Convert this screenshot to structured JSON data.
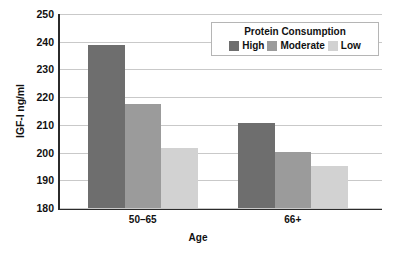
{
  "chart_data": {
    "type": "bar",
    "title": "",
    "xlabel": "Age",
    "ylabel": "IGF-I ng/ml",
    "ylim": [
      180,
      250
    ],
    "yticks": [
      180,
      190,
      200,
      210,
      220,
      230,
      240,
      250
    ],
    "grid": true,
    "categories": [
      "50–65",
      "66+"
    ],
    "legend_title": "Protein Consumption",
    "legend_position": "top-right-inside",
    "series": [
      {
        "name": "High",
        "color": "#6e6e6e",
        "values": [
          238.8,
          210.6
        ]
      },
      {
        "name": "Moderate",
        "color": "#9b9b9b",
        "values": [
          217.5,
          200.3
        ]
      },
      {
        "name": "Low",
        "color": "#d2d2d2",
        "values": [
          201.5,
          195.0
        ]
      }
    ]
  },
  "axis": {
    "y_title": "IGF-I ng/ml",
    "x_title": "Age",
    "y_tick_labels": [
      "250",
      "240",
      "230",
      "220",
      "210",
      "200",
      "190",
      "180"
    ],
    "x_tick_labels": [
      "50–65",
      "66+"
    ]
  },
  "legend": {
    "title": "Protein Consumption",
    "items": [
      {
        "label": "High",
        "color": "#6e6e6e"
      },
      {
        "label": "Moderate",
        "color": "#9b9b9b"
      },
      {
        "label": "Low",
        "color": "#d2d2d2"
      }
    ]
  },
  "colors": {
    "axis_line": "#2b2b2b",
    "gridline": "#c9c9c9",
    "background": "#ffffff",
    "text": "#111111"
  }
}
